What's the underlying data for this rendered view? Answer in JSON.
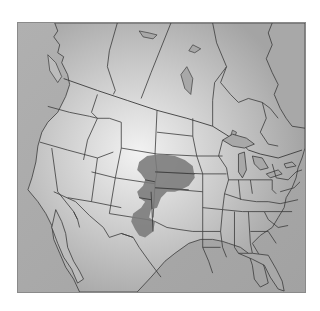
{
  "map": {
    "type": "range-map",
    "region": "North America (United States, southern Canada, northern Mexico)",
    "projection": "conic",
    "background_color": "#b4b4b4",
    "land_light_color": "#d8d8d8",
    "ocean_color": "#a6a6a6",
    "border_color": "#3a3a3a",
    "frame_color": "#8a8a8a",
    "highlight": {
      "label": "range",
      "color": "#7a7a7a",
      "covers": [
        "Nebraska",
        "Kansas",
        "eastern Colorado",
        "Oklahoma panhandle",
        "western Oklahoma",
        "Texas panhandle",
        "eastern New Mexico"
      ]
    }
  }
}
